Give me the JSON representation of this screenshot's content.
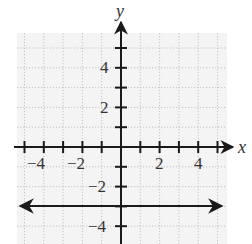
{
  "chart_data": {
    "type": "line",
    "title": "",
    "xlabel": "x",
    "ylabel": "y",
    "xlim": [
      -5.5,
      5.5
    ],
    "ylim": [
      -5,
      5.5
    ],
    "grid": true,
    "x_tick_labels": [
      "-4",
      "-2",
      "2",
      "4"
    ],
    "y_tick_labels": [
      "4",
      "2",
      "-2",
      "-4"
    ],
    "x_ticks": [
      -5,
      -4,
      -3,
      -2,
      -1,
      1,
      2,
      3,
      4,
      5
    ],
    "y_ticks": [
      5,
      4,
      3,
      2,
      1,
      -1,
      -2,
      -3,
      -4
    ],
    "series": [
      {
        "name": "y = -3",
        "kind": "horizontal line with arrows on both ends",
        "x": [
          -5.5,
          5.5
        ],
        "y": [
          -3,
          -3
        ]
      }
    ]
  },
  "labels": {
    "x_axis": "x",
    "y_axis": "y",
    "xt_m4": "−4",
    "xt_m2": "−2",
    "xt_2": "2",
    "xt_4": "4",
    "yt_4": "4",
    "yt_2": "2",
    "yt_m2": "−2",
    "yt_m4": "−4"
  },
  "colors": {
    "background": "#ffffff",
    "grid_bg": "#f3f3f3",
    "grid": "#c4c4c4",
    "axis": "#1a1a1a",
    "line": "#1a1a1a"
  }
}
